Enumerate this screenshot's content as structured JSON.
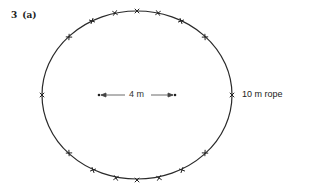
{
  "question": {
    "number": "3",
    "part": "(a)"
  },
  "diagram": {
    "shape": "ellipse",
    "center": [
      137,
      95
    ],
    "rx": 95,
    "ry": 84,
    "stroke_color": "#2a2a2a",
    "foci": [
      [
        99,
        95
      ],
      [
        175,
        95
      ]
    ],
    "focal_distance_label": "4 m",
    "rope_label": "10 m rope",
    "markers": [
      [
        69,
        37
      ],
      [
        92,
        21
      ],
      [
        115,
        13
      ],
      [
        137,
        11
      ],
      [
        158,
        13
      ],
      [
        181,
        21
      ],
      [
        205,
        37
      ],
      [
        42,
        95
      ],
      [
        232,
        95
      ],
      [
        69,
        153
      ],
      [
        93,
        170
      ],
      [
        116,
        178
      ],
      [
        137,
        180
      ],
      [
        159,
        178
      ],
      [
        182,
        170
      ],
      [
        205,
        153
      ]
    ]
  }
}
